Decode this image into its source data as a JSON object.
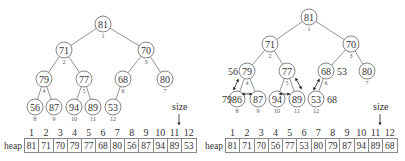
{
  "left": {
    "nodes": [
      {
        "i": 1,
        "v": "81",
        "x": 103,
        "y": 24
      },
      {
        "i": 2,
        "v": "71",
        "x": 64,
        "y": 50
      },
      {
        "i": 3,
        "v": "70",
        "x": 146,
        "y": 50
      },
      {
        "i": 4,
        "v": "79",
        "x": 44,
        "y": 79
      },
      {
        "i": 5,
        "v": "77",
        "x": 84,
        "y": 79
      },
      {
        "i": 6,
        "v": "68",
        "x": 123,
        "y": 79
      },
      {
        "i": 7,
        "v": "80",
        "x": 165,
        "y": 79
      },
      {
        "i": 8,
        "v": "56",
        "x": 35,
        "y": 107
      },
      {
        "i": 9,
        "v": "87",
        "x": 54,
        "y": 107
      },
      {
        "i": 10,
        "v": "94",
        "x": 74,
        "y": 107
      },
      {
        "i": 11,
        "v": "89",
        "x": 93,
        "y": 107
      },
      {
        "i": 12,
        "v": "53",
        "x": 113,
        "y": 107
      }
    ],
    "size_label": "size",
    "table": {
      "label": "heap",
      "indices": [
        "1",
        "2",
        "3",
        "4",
        "5",
        "6",
        "7",
        "8",
        "9",
        "10",
        "11",
        "12"
      ],
      "values": [
        "81",
        "71",
        "70",
        "79",
        "77",
        "68",
        "80",
        "56",
        "87",
        "94",
        "89",
        "53"
      ]
    }
  },
  "right": {
    "nodes": [
      {
        "i": 1,
        "v": "81",
        "x": 309,
        "y": 17
      },
      {
        "i": 2,
        "v": "71",
        "x": 270,
        "y": 44
      },
      {
        "i": 3,
        "v": "70",
        "x": 351,
        "y": 44
      },
      {
        "i": 4,
        "v": "79",
        "x": 247,
        "y": 71
      },
      {
        "i": 5,
        "v": "77",
        "x": 287,
        "y": 71
      },
      {
        "i": 6,
        "v": "68",
        "x": 326,
        "y": 71
      },
      {
        "i": 7,
        "v": "80",
        "x": 367,
        "y": 71
      },
      {
        "i": 8,
        "v": "86",
        "x": 237,
        "y": 99
      },
      {
        "i": 9,
        "v": "87",
        "x": 258,
        "y": 99
      },
      {
        "i": 10,
        "v": "94",
        "x": 277,
        "y": 99
      },
      {
        "i": 11,
        "v": "89",
        "x": 297,
        "y": 99
      },
      {
        "i": 12,
        "v": "53",
        "x": 316,
        "y": 99
      }
    ],
    "annotations": [
      {
        "text": "56",
        "x": 228,
        "y": 71
      },
      {
        "text": "79",
        "x": 222,
        "y": 99
      },
      {
        "text": "53",
        "x": 337,
        "y": 71
      },
      {
        "text": "68",
        "x": 327,
        "y": 99
      }
    ],
    "size_label": "size",
    "table": {
      "label": "heap",
      "indices": [
        "1",
        "2",
        "3",
        "4",
        "5",
        "6",
        "7",
        "8",
        "9",
        "10",
        "11",
        "12"
      ],
      "values": [
        "81",
        "71",
        "70",
        "56",
        "77",
        "53",
        "80",
        "79",
        "87",
        "94",
        "89",
        "68"
      ]
    }
  }
}
